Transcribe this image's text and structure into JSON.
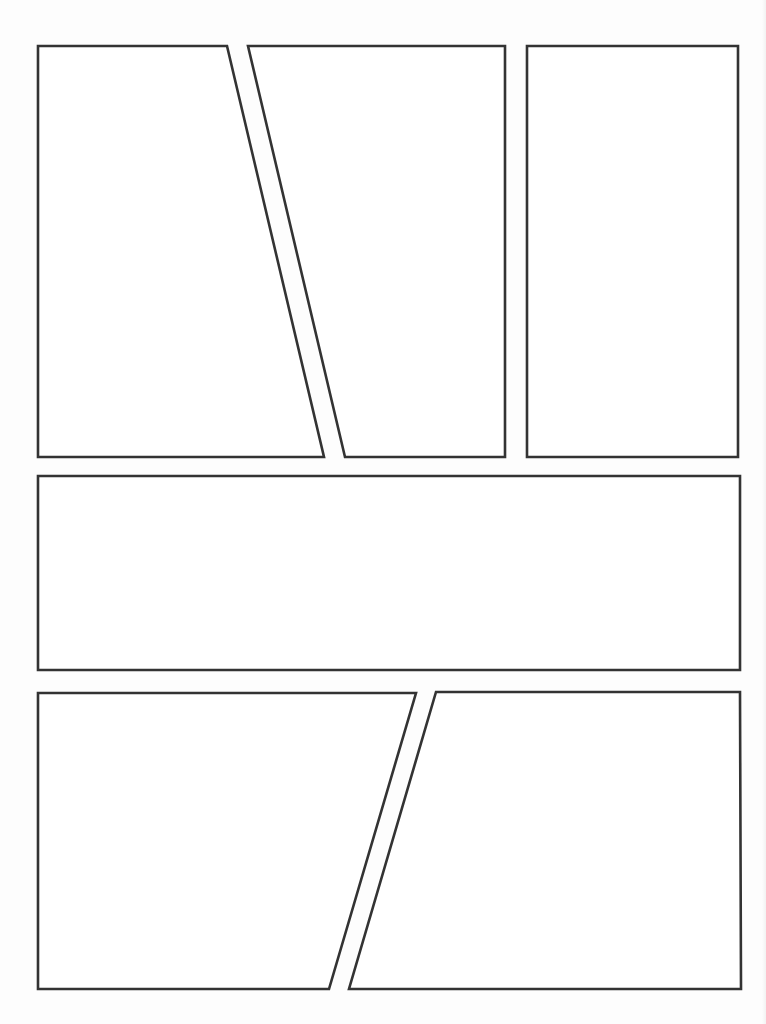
{
  "page": {
    "type": "comic-page-template",
    "panel_count": 6,
    "line_color": "#333333",
    "background_color": "#ffffff"
  },
  "panels": [
    {
      "id": "panel-1",
      "row": 1,
      "shape": "trapezoid",
      "content": ""
    },
    {
      "id": "panel-2",
      "row": 1,
      "shape": "trapezoid",
      "content": ""
    },
    {
      "id": "panel-3",
      "row": 1,
      "shape": "rectangle",
      "content": ""
    },
    {
      "id": "panel-4",
      "row": 2,
      "shape": "rectangle",
      "content": ""
    },
    {
      "id": "panel-5",
      "row": 3,
      "shape": "trapezoid",
      "content": ""
    },
    {
      "id": "panel-6",
      "row": 3,
      "shape": "trapezoid",
      "content": ""
    }
  ]
}
